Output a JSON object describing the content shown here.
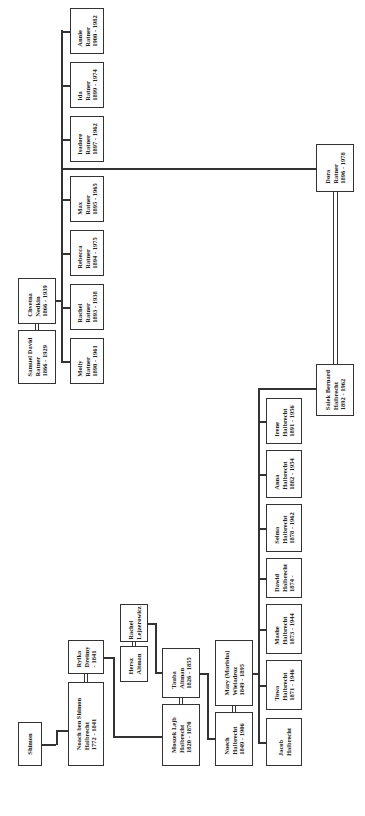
{
  "diagram": {
    "type": "family-tree",
    "orientation": "rotated-90",
    "persons": {
      "shimon": {
        "lines": [
          "Shimon"
        ]
      },
      "noach": {
        "lines": [
          "Noach ben Shimon",
          "Halbrecht",
          "1772 - 1841"
        ]
      },
      "ryfka": {
        "lines": [
          "Ryfka",
          "Dreimy",
          "- 1841"
        ]
      },
      "hersz": {
        "lines": [
          "Hersz",
          "Altman"
        ]
      },
      "rachel_l": {
        "lines": [
          "Rachel",
          "Lejzerowicz"
        ]
      },
      "moszek": {
        "lines": [
          "Moszek Lejb",
          "Halbrecht",
          "1820 - 1870"
        ]
      },
      "tauba": {
        "lines": [
          "Tauba",
          "Altman",
          "1826 - 1855"
        ]
      },
      "noech": {
        "lines": [
          "Noech",
          "Halbrecht",
          "1849 - 1906"
        ]
      },
      "mary": {
        "lines": [
          "Mary (Marisha)",
          "Wieladroz",
          "1849 - 1895"
        ]
      },
      "jacob": {
        "lines": [
          "Jacob",
          "Halbrecht"
        ]
      },
      "towa": {
        "lines": [
          "Towa",
          "Halbrecht",
          "1871 - 1946"
        ]
      },
      "mashe": {
        "lines": [
          "Mashe",
          "Halbrecht",
          "1873 - 1944"
        ]
      },
      "dawid": {
        "lines": [
          "Dawid",
          "Halbrecht",
          "1874 -"
        ]
      },
      "selma": {
        "lines": [
          "Selma",
          "Halbrecht",
          "1878 - 1962"
        ]
      },
      "anna": {
        "lines": [
          "Anna",
          "Halbrecht",
          "1882 - 1954"
        ]
      },
      "irene": {
        "lines": [
          "Irene",
          "Halbrecht",
          "1891 - 1956"
        ]
      },
      "salek": {
        "lines": [
          "Salek Bernard",
          "Halbrecht",
          "1892 - 1962"
        ]
      },
      "dora": {
        "lines": [
          "Dora",
          "Ratner",
          "1896 - 1978"
        ]
      },
      "samuel": {
        "lines": [
          "Samuel David",
          "Ratner",
          "1866 - 1929"
        ]
      },
      "chvetna": {
        "lines": [
          "Chvetna",
          "Nedkin",
          "1866 - 1939"
        ]
      },
      "molly": {
        "lines": [
          "Molly",
          "Ratner",
          "1890 - 1961"
        ]
      },
      "rachel_r": {
        "lines": [
          "Rachel",
          "Ratner",
          "1893 - 1938"
        ]
      },
      "rebecca": {
        "lines": [
          "Rebecca",
          "Ratner",
          "1894 - 1975"
        ]
      },
      "max": {
        "lines": [
          "Max",
          "Ratner",
          "1895 - 1965"
        ]
      },
      "isadore": {
        "lines": [
          "Isadore",
          "Ratner",
          "1897 - 1962"
        ]
      },
      "ida": {
        "lines": [
          "Ida",
          "Ratner",
          "1899 - 1974"
        ]
      },
      "annie": {
        "lines": [
          "Annie",
          "Ratner",
          "1900 - 1982"
        ]
      }
    },
    "colors": {
      "line": "#333333",
      "box_fill": "#ffffff",
      "background": "#ffffff"
    }
  }
}
